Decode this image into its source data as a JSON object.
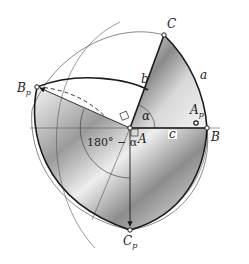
{
  "figure": {
    "type": "spherical triangle polar construction",
    "labels": {
      "C": "C",
      "a": "a",
      "b": "b",
      "alpha": "α",
      "A_p_main": "A",
      "A_p_sub": "p",
      "B": "B",
      "A": "A",
      "c": "c",
      "B_p_main": "B",
      "B_p_sub": "p",
      "supplement": "180° − α",
      "C_p_main": "C",
      "C_p_sub": "p"
    },
    "points": {
      "A": [
        130,
        128
      ],
      "B": [
        207,
        128
      ],
      "C": [
        164,
        35
      ],
      "A_p": [
        196,
        124
      ],
      "B_p": [
        37,
        87
      ],
      "C_p": [
        130,
        230
      ]
    },
    "colors": {
      "stroke": "#1a1a1a",
      "thin_line": "#555555",
      "shade_dark": "#6e6e6e",
      "shade_light": "#f4f4f4",
      "background": "#ffffff"
    }
  }
}
